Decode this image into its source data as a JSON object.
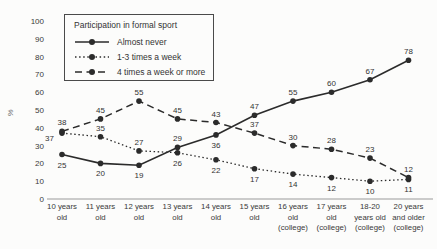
{
  "chart_data": {
    "type": "line",
    "title": "Participation in formal sport",
    "xlabel": "",
    "ylabel": "%",
    "ylim": [
      0,
      100
    ],
    "yticks": [
      0,
      10,
      20,
      30,
      40,
      50,
      60,
      70,
      80,
      90,
      100
    ],
    "grid": false,
    "legend_position": "top-left",
    "line_color": "#2b2b2b",
    "axis_color": "#9a9a9a",
    "categories": [
      [
        "10 years",
        "old"
      ],
      [
        "11 years",
        "old"
      ],
      [
        "12 years",
        "old"
      ],
      [
        "13 years",
        "old"
      ],
      [
        "14 years",
        "old"
      ],
      [
        "15 years",
        "old"
      ],
      [
        "16 years",
        "old",
        "(college)"
      ],
      [
        "17 years",
        "old",
        "(college)"
      ],
      [
        "18-20",
        "years old",
        "(college)"
      ],
      [
        "20 years",
        "and older",
        "(college)"
      ]
    ],
    "series": [
      {
        "name": "Almost never",
        "dash": "",
        "stroke_width": 1.6,
        "values": [
          25,
          20,
          19,
          29,
          36,
          47,
          55,
          60,
          67,
          78
        ],
        "label_pos": [
          "below",
          "below",
          "below",
          "above",
          "below",
          "above",
          "above",
          "above",
          "above",
          "above"
        ]
      },
      {
        "name": "1-3 times a week",
        "dash": "1.5 2.6",
        "stroke_width": 1.3,
        "values": [
          37,
          35,
          27,
          26,
          22,
          17,
          14,
          12,
          10,
          11
        ],
        "label_pos": [
          "left",
          "above",
          "above",
          "below",
          "below",
          "below",
          "below",
          "below",
          "below",
          "below"
        ]
      },
      {
        "name": "4 times a week or more",
        "dash": "7 4.5",
        "stroke_width": 1.5,
        "values": [
          38,
          45,
          55,
          45,
          43,
          37,
          30,
          28,
          23,
          12
        ],
        "label_pos": [
          "above",
          "above",
          "above",
          "above",
          "above",
          "above",
          "above",
          "above",
          "above",
          "above"
        ]
      }
    ]
  }
}
